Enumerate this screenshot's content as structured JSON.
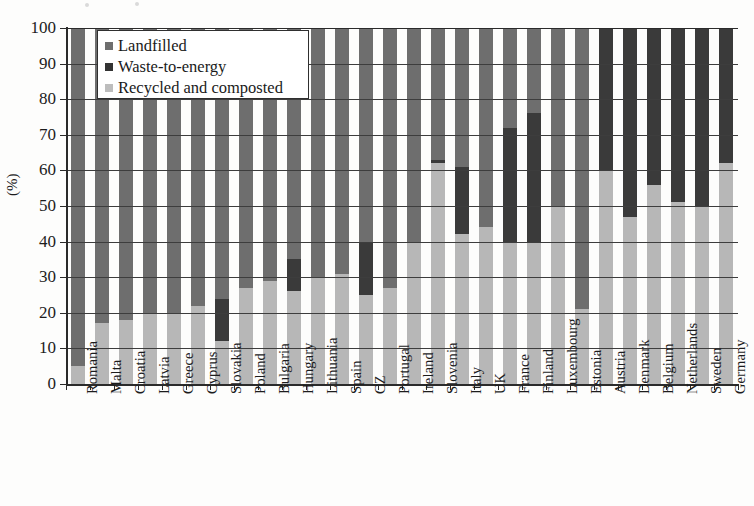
{
  "figure": {
    "y_axis_title": "(%)",
    "y_ticks": [
      0,
      10,
      20,
      30,
      40,
      50,
      60,
      70,
      80,
      90,
      100
    ]
  },
  "legend": {
    "position": "top-left-inside",
    "items": [
      {
        "label": "Landfilled",
        "color": "#6e6e6e",
        "key": "landfilled"
      },
      {
        "label": "Waste-to-energy",
        "color": "#333333",
        "key": "waste_to_energy"
      },
      {
        "label": "Recycled and composted",
        "color": "#bdbdbd",
        "key": "recycled_and_composted"
      }
    ]
  },
  "chart_data": {
    "type": "bar",
    "subtype": "stacked-percentage",
    "title": "",
    "xlabel": "",
    "ylabel": "(%)",
    "ylim": [
      0,
      100
    ],
    "ytick_step": 10,
    "grid": true,
    "legend_position": "upper left",
    "stack_order_bottom_to_top": [
      "Recycled and composted",
      "Waste-to-energy",
      "Landfilled"
    ],
    "categories": [
      "Romania",
      "Malta",
      "Croatia",
      "Latvia",
      "Greece",
      "Cyprus",
      "Slovakia",
      "Poland",
      "Bulgaria",
      "Hungary",
      "Lithuania",
      "Spain",
      "CZ",
      "Portugal",
      "Ireland",
      "Slovenia",
      "Italy",
      "UK",
      "France",
      "Finland",
      "Luxembourg",
      "Estonia",
      "Austria",
      "Denmark",
      "Belgium",
      "Netherlands",
      "Sweden",
      "Germany"
    ],
    "series": [
      {
        "name": "Recycled and composted",
        "color": "#b7b7b7",
        "values": [
          5,
          17,
          18,
          20,
          20,
          22,
          12,
          27,
          29,
          26,
          30,
          31,
          25,
          27,
          40,
          62,
          42,
          44,
          40,
          40,
          50,
          21,
          60,
          47,
          56,
          51,
          50,
          62
        ]
      },
      {
        "name": "Waste-to-energy",
        "color": "#3a3a3a",
        "values": [
          0,
          0,
          0,
          0,
          0,
          0,
          12,
          0,
          0,
          9,
          0,
          0,
          15,
          0,
          0,
          1,
          19,
          0,
          32,
          36,
          0,
          0,
          40,
          53,
          44,
          49,
          50,
          38
        ]
      },
      {
        "name": "Landfilled",
        "color": "#6e6e6e",
        "values": [
          95,
          83,
          82,
          80,
          80,
          78,
          76,
          73,
          71,
          65,
          70,
          69,
          60,
          73,
          60,
          37,
          39,
          56,
          28,
          24,
          50,
          79,
          0,
          0,
          0,
          0,
          0,
          0
        ]
      }
    ]
  }
}
